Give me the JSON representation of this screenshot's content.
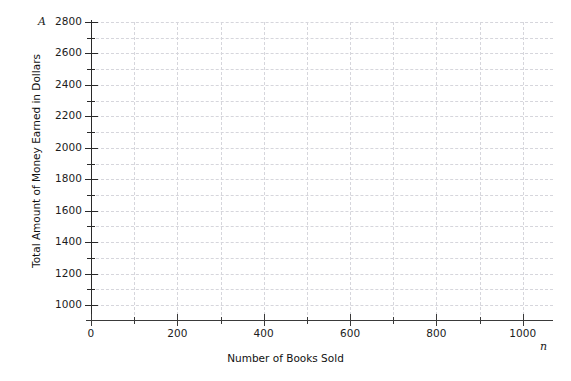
{
  "chart_data": {
    "type": "scatter",
    "title": "",
    "subtitle": "",
    "xlabel": "Number of Books Sold",
    "ylabel": "Total Amount of Money Earned in Dollars",
    "x_variable_symbol": "n",
    "y_variable_symbol": "A",
    "xlim": [
      0,
      1070
    ],
    "ylim": [
      950,
      2800
    ],
    "x_major_ticks": [
      0,
      200,
      400,
      600,
      800,
      1000
    ],
    "x_minor_ticks": [
      100,
      300,
      500,
      700,
      900
    ],
    "x_tick_labels": [
      "0",
      "200",
      "400",
      "600",
      "800",
      "1000"
    ],
    "y_major_ticks": [
      1000,
      1200,
      1400,
      1600,
      1800,
      2000,
      2200,
      2400,
      2600,
      2800
    ],
    "y_minor_ticks": [
      1100,
      1300,
      1500,
      1700,
      1900,
      2100,
      2300,
      2500,
      2700
    ],
    "y_tick_labels": [
      "1000",
      "1200",
      "1400",
      "1600",
      "1800",
      "2000",
      "2200",
      "2400",
      "2600",
      "2800"
    ],
    "grid": true,
    "grid_style": "dashed",
    "grid_color": "#d6d6dc",
    "grid_x_step": 100,
    "grid_y_step": 100,
    "legend": false,
    "legend_position": "none",
    "series": [],
    "values": [],
    "annotations": [],
    "axis_color": "#2a2a2a",
    "background_color": "#ffffff",
    "text_color": "#1c1c1c"
  }
}
